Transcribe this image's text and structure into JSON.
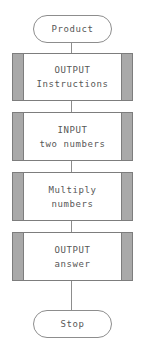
{
  "diagram": {
    "type": "flowchart",
    "orientation": "vertical",
    "colors": {
      "background": "#ffffff",
      "shape_fill": "#ffffff",
      "sidebar_fill": "#a9a9a9",
      "border": "#7d7d7d",
      "text": "#575757",
      "connector": "#8d8d8d"
    },
    "nodes": [
      {
        "id": "start",
        "shape": "terminator",
        "label": "Product",
        "lines": [
          "Product"
        ]
      },
      {
        "id": "output-instructions",
        "shape": "predefined-process",
        "label": "OUTPUT Instructions",
        "lines": [
          "OUTPUT",
          "Instructions"
        ]
      },
      {
        "id": "input-two-numbers",
        "shape": "predefined-process",
        "label": "INPUT two numbers",
        "lines": [
          "INPUT",
          "two numbers"
        ]
      },
      {
        "id": "multiply-numbers",
        "shape": "predefined-process",
        "label": "Multiply numbers",
        "lines": [
          "Multiply",
          "numbers"
        ]
      },
      {
        "id": "output-answer",
        "shape": "predefined-process",
        "label": "OUTPUT answer",
        "lines": [
          "OUTPUT",
          "answer"
        ]
      },
      {
        "id": "stop",
        "shape": "terminator",
        "label": "Stop",
        "lines": [
          "Stop"
        ]
      }
    ],
    "edges": [
      {
        "from": "start",
        "to": "output-instructions"
      },
      {
        "from": "output-instructions",
        "to": "input-two-numbers"
      },
      {
        "from": "input-two-numbers",
        "to": "multiply-numbers"
      },
      {
        "from": "multiply-numbers",
        "to": "output-answer"
      },
      {
        "from": "output-answer",
        "to": "stop"
      }
    ]
  }
}
